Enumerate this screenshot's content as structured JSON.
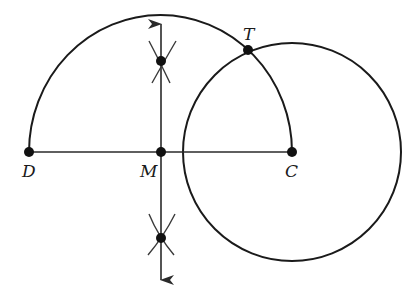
{
  "diagram": {
    "colors": {
      "stroke": "#1a1a1a",
      "background": "#ffffff"
    },
    "points": {
      "D": {
        "label": "D",
        "x": 29,
        "y": 152
      },
      "M": {
        "label": "M",
        "x": 161,
        "y": 152
      },
      "C": {
        "label": "C",
        "x": 292,
        "y": 152
      },
      "T": {
        "label": "T",
        "x": 248,
        "y": 50
      },
      "upper_arc_intersection": {
        "x": 161,
        "y": 61
      },
      "lower_arc_intersection": {
        "x": 161,
        "y": 238
      }
    },
    "labels": {
      "D": "D",
      "M": "M",
      "C": "C",
      "T": "T"
    }
  }
}
